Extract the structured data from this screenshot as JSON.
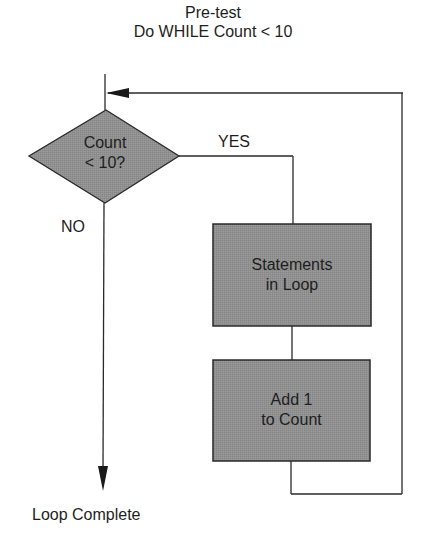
{
  "diagram": {
    "title_line1": "Pre-test",
    "title_line2": "Do WHILE Count < 10",
    "type": "flowchart",
    "nodes": [
      {
        "id": "decision",
        "shape": "diamond",
        "line1": "Count",
        "line2": "< 10?"
      },
      {
        "id": "statements",
        "shape": "rectangle",
        "line1": "Statements",
        "line2": "in Loop"
      },
      {
        "id": "increment",
        "shape": "rectangle",
        "line1": "Add 1",
        "line2": "to Count"
      }
    ],
    "edges": [
      {
        "from": "entry",
        "to": "decision",
        "label": ""
      },
      {
        "from": "decision",
        "to": "statements",
        "label": "YES"
      },
      {
        "from": "statements",
        "to": "increment",
        "label": ""
      },
      {
        "from": "increment",
        "to": "decision",
        "label": ""
      },
      {
        "from": "decision",
        "to": "exit",
        "label": "NO"
      }
    ],
    "labels": {
      "yes": "YES",
      "no": "NO",
      "exit": "Loop Complete"
    },
    "colors": {
      "shape_fill": "#8e8e8e",
      "stroke": "#2a2a2a",
      "background": "#ffffff"
    }
  }
}
